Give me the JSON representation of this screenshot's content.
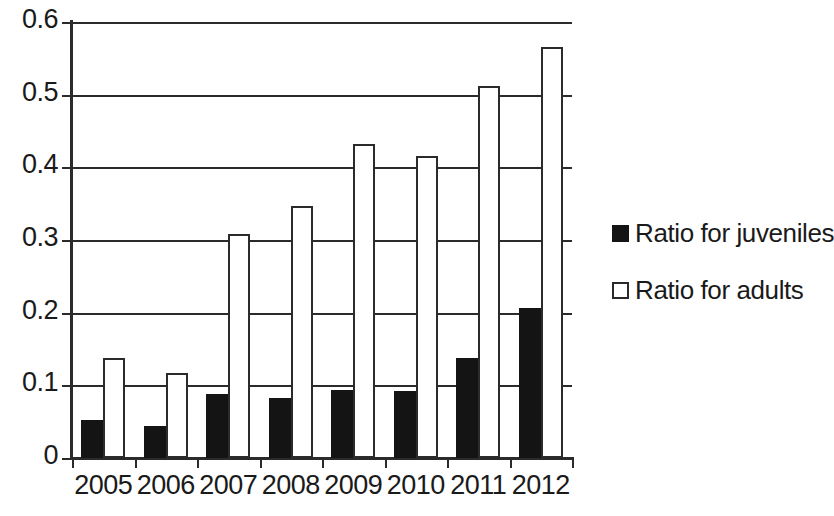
{
  "chart_data": {
    "type": "bar",
    "title": "",
    "xlabel": "",
    "ylabel": "",
    "categories": [
      "2005",
      "2006",
      "2007",
      "2008",
      "2009",
      "2010",
      "2011",
      "2012"
    ],
    "series": [
      {
        "name": "Ratio for juveniles",
        "marker": "filled-square",
        "color": "#141414",
        "values": [
          0.052,
          0.044,
          0.088,
          0.082,
          0.094,
          0.092,
          0.137,
          0.207
        ]
      },
      {
        "name": "Ratio for adults",
        "marker": "hollow-square",
        "color": "#ffffff",
        "values": [
          0.137,
          0.117,
          0.308,
          0.347,
          0.432,
          0.416,
          0.512,
          0.565
        ]
      }
    ],
    "ylim": [
      0,
      0.6
    ],
    "yticks": [
      0,
      0.1,
      0.2,
      0.3,
      0.4,
      0.5,
      0.6
    ],
    "ytick_labels": [
      "0",
      "0.1",
      "0.2",
      "0.3",
      "0.4",
      "0.5",
      "0.6"
    ],
    "grid": "horizontal",
    "legend_position": "right",
    "bar_layout": "grouped-adjacent"
  },
  "legend": {
    "items": [
      {
        "label": "Ratio for juveniles",
        "swatch": "filled-square-icon"
      },
      {
        "label": "Ratio for adults",
        "swatch": "hollow-square-icon"
      }
    ]
  }
}
